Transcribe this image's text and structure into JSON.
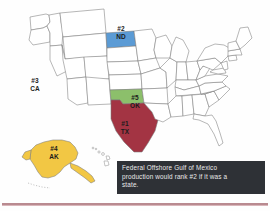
{
  "figure": {
    "background_color": "#fefefe",
    "base_state_fill": "#ffffff",
    "base_state_stroke": "#7a7a7a"
  },
  "map": {
    "states": [
      {
        "id": "tx",
        "name": "Texas",
        "abbr": "TX",
        "rank": "#1",
        "color": "#a33443",
        "label_x": 122,
        "label_y": 122
      },
      {
        "id": "nd",
        "name": "North Dakota",
        "abbr": "ND",
        "rank": "#2",
        "color": "#5b9bd5",
        "label_x": 117,
        "label_y": 26
      },
      {
        "id": "ca",
        "name": "California",
        "abbr": "CA",
        "rank": "#3",
        "color": "#c57a33",
        "label_x": 31,
        "label_y": 79
      },
      {
        "id": "ak",
        "name": "Alaska",
        "abbr": "AK",
        "rank": "#4",
        "color": "#f2c744",
        "label_x": 50,
        "label_y": 147
      },
      {
        "id": "ok",
        "name": "Oklahoma",
        "abbr": "OK",
        "rank": "#5",
        "color": "#8cbf6b",
        "label_x": 131,
        "label_y": 96
      }
    ]
  },
  "note": {
    "background_color": "#2e3136",
    "text_color": "#e9e9ea",
    "full_text": "Federal Offshore Gulf of Mexico production would rank #2 if it was a state.",
    "lines": [
      "Federal Offshore Gulf of Mexico",
      "production would rank #2 if it was a",
      "state."
    ]
  },
  "divider": {
    "color": "#b98a90"
  }
}
